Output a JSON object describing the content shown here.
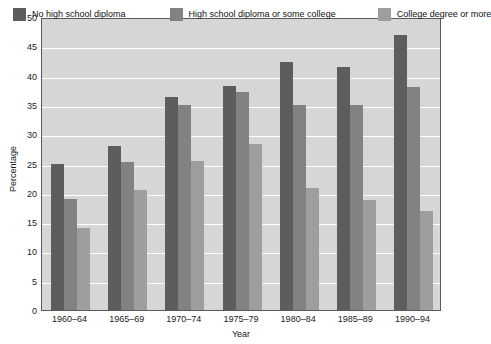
{
  "chart_data": {
    "type": "bar",
    "title": "",
    "xlabel": "Year",
    "ylabel": "Percentage",
    "ylim": [
      0,
      50
    ],
    "ytick_step": 5,
    "yticks": [
      "50",
      "45",
      "40",
      "35",
      "30",
      "25",
      "20",
      "15",
      "10",
      "5",
      "0"
    ],
    "grid": true,
    "legend_position": "top",
    "categories": [
      "1960–64",
      "1965–69",
      "1970–74",
      "1975–79",
      "1980–84",
      "1985–89",
      "1990–94"
    ],
    "series": [
      {
        "name": "No high school diploma",
        "color": "#5d5d5d",
        "values": [
          25,
          28,
          36.3,
          38.2,
          42.3,
          41.5,
          47
        ]
      },
      {
        "name": "High school diploma or some college",
        "color": "#828282",
        "values": [
          19,
          25.2,
          35,
          37.2,
          35,
          35,
          38
        ]
      },
      {
        "name": "College degree or more",
        "color": "#9e9e9e",
        "values": [
          14,
          20.5,
          25.4,
          28.3,
          20.8,
          18.8,
          16.9
        ]
      }
    ]
  },
  "colors": {
    "plot_background": "#d6d6d6",
    "gridline": "#ffffff",
    "axis": "#5a5a5a",
    "text": "#1a1a1a",
    "page_background": "#ffffff"
  }
}
